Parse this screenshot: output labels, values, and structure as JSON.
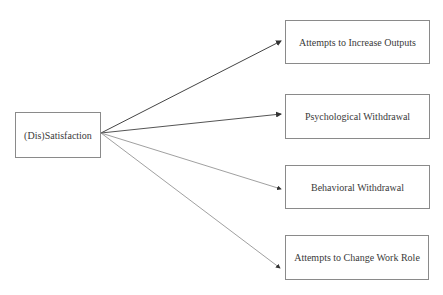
{
  "diagram": {
    "source": {
      "label": "(Dis)Satisfaction"
    },
    "targets": [
      {
        "label": "Attempts to Increase Outputs"
      },
      {
        "label": "Psychological Withdrawal"
      },
      {
        "label": "Behavioral Withdrawal"
      },
      {
        "label": "Attempts to Change Work Role"
      }
    ],
    "edges": [
      {
        "from": "(Dis)Satisfaction",
        "to": "Attempts to Increase Outputs"
      },
      {
        "from": "(Dis)Satisfaction",
        "to": "Psychological Withdrawal"
      },
      {
        "from": "(Dis)Satisfaction",
        "to": "Behavioral Withdrawal"
      },
      {
        "from": "(Dis)Satisfaction",
        "to": "Attempts to Change Work Role"
      }
    ],
    "colors": {
      "line": "#555555",
      "line_light": "#8c8c8c",
      "border": "#8a8a8a",
      "text": "#3a3a3a"
    }
  }
}
